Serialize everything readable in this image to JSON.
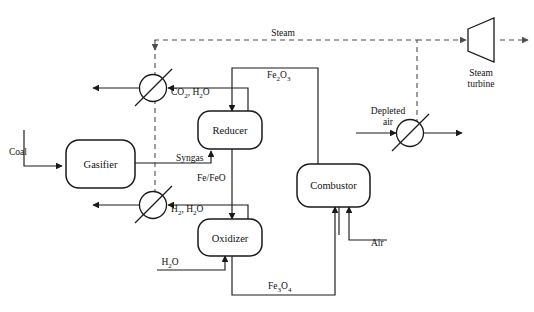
{
  "diagram": {
    "background_color": "#ffffff",
    "line_color": "#1a1a1a",
    "dashed_line_color": "#4d4d4d",
    "width": 534,
    "height": 312,
    "units": [
      {
        "id": "gasifier",
        "label": "Gasifier",
        "shape": "rounded-rect"
      },
      {
        "id": "reducer",
        "label": "Reducer",
        "shape": "rounded-rect"
      },
      {
        "id": "oxidizer",
        "label": "Oxidizer",
        "shape": "rounded-rect"
      },
      {
        "id": "combustor",
        "label": "Combustor",
        "shape": "rounded-rect"
      }
    ],
    "equipment": [
      {
        "id": "hx-top",
        "label": "",
        "shape": "circle-with-slash",
        "type": "heat-exchanger"
      },
      {
        "id": "hx-mid",
        "label": "",
        "shape": "circle-with-slash",
        "type": "heat-exchanger"
      },
      {
        "id": "hx-right",
        "label": "",
        "shape": "circle-with-slash",
        "type": "heat-exchanger"
      },
      {
        "id": "steam-turbine",
        "label_line1": "Steam",
        "label_line2": "turbine",
        "shape": "trapezoid",
        "type": "turbine"
      }
    ],
    "streams": [
      {
        "id": "coal",
        "label": "Coal",
        "style": "solid"
      },
      {
        "id": "syngas",
        "label": "Syngas",
        "style": "solid"
      },
      {
        "id": "co2-h2o",
        "label": "CO2, H2O",
        "style": "solid"
      },
      {
        "id": "h2-h2o",
        "label": "H2, H2O",
        "style": "solid"
      },
      {
        "id": "water-in",
        "label": "H2O",
        "style": "solid"
      },
      {
        "id": "fe2o3",
        "label": "Fe2O3",
        "style": "solid"
      },
      {
        "id": "fe-feo",
        "label": "Fe/FeO",
        "style": "solid"
      },
      {
        "id": "fe3o4",
        "label": "Fe3O4",
        "style": "solid"
      },
      {
        "id": "air",
        "label": "Air",
        "style": "solid"
      },
      {
        "id": "depleted-air",
        "label": "Depleted air",
        "style": "solid"
      },
      {
        "id": "steam",
        "label": "Steam",
        "style": "dashed"
      }
    ],
    "labels": {
      "coal": "Coal",
      "syngas": "Syngas",
      "co2_h2o_main": "CO",
      "co2_h2o_sub1": "2",
      "co2_h2o_mid": ", H",
      "co2_h2o_sub2": "2",
      "co2_h2o_end": "O",
      "h2_h2o_main": "H",
      "h2_h2o_sub1": "2",
      "h2_h2o_mid": ", H",
      "h2_h2o_sub2": "2",
      "h2_h2o_end": "O",
      "h2o_main": "H",
      "h2o_sub": "2",
      "h2o_end": "O",
      "fe2o3_a": "Fe",
      "fe2o3_sub1": "2",
      "fe2o3_b": "O",
      "fe2o3_sub2": "3",
      "fe_feo": "Fe/FeO",
      "fe3o4_a": "Fe",
      "fe3o4_sub1": "3",
      "fe3o4_b": "O",
      "fe3o4_sub2": "4",
      "air": "Air",
      "depleted_line1": "Depleted",
      "depleted_line2": "air",
      "steam": "Steam",
      "turbine_line1": "Steam",
      "turbine_line2": "turbine",
      "gasifier": "Gasifier",
      "reducer": "Reducer",
      "oxidizer": "Oxidizer",
      "combustor": "Combustor"
    }
  }
}
